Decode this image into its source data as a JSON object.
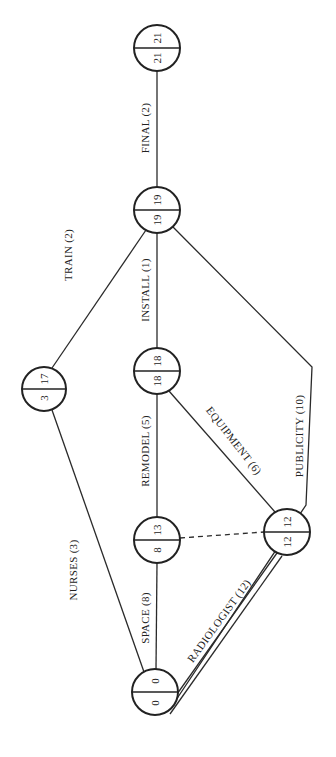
{
  "diagram": {
    "type": "activity-on-arrow network (PERT/CPM)",
    "orientation": "rotated 90 degrees counter-clockwise",
    "nodes": [
      {
        "id": "n0",
        "early": "0",
        "late": "0",
        "cx": 155,
        "cy": 692
      },
      {
        "id": "n8",
        "early": "8",
        "late": "13",
        "cx": 157,
        "cy": 540
      },
      {
        "id": "n12",
        "early": "12",
        "late": "12",
        "cx": 287,
        "cy": 532
      },
      {
        "id": "n18",
        "early": "18",
        "late": "18",
        "cx": 157,
        "cy": 371
      },
      {
        "id": "n19",
        "early": "19",
        "late": "19",
        "cx": 157,
        "cy": 210
      },
      {
        "id": "n21",
        "early": "21",
        "late": "21",
        "cx": 157,
        "cy": 48
      },
      {
        "id": "n3",
        "early": "3",
        "late": "17",
        "cx": 44,
        "cy": 389
      }
    ],
    "activities": [
      {
        "label": "SPACE (8)",
        "from": "0",
        "to": "8/13"
      },
      {
        "label": "NURSES (3)",
        "from": "0",
        "to": "3/17"
      },
      {
        "label": "TRAIN (2)",
        "from": "3/17",
        "to": "19"
      },
      {
        "label": "REMODEL (5)",
        "from": "8/13",
        "to": "18"
      },
      {
        "label": "EQUIPMENT (6)",
        "from": "12",
        "to": "18"
      },
      {
        "label": "INSTALL (1)",
        "from": "18",
        "to": "19"
      },
      {
        "label": "FINAL (2)",
        "from": "19",
        "to": "21"
      },
      {
        "label": "RADIOLOGIST (12)",
        "from": "0",
        "to": "12"
      },
      {
        "label": "PUBLICITY (10)",
        "from": "0",
        "to": "19"
      },
      {
        "label": "dummy",
        "from": "8/13",
        "to": "12",
        "style": "dashed"
      }
    ]
  },
  "labels": {
    "space": "SPACE (8)",
    "nurses": "NURSES (3)",
    "train": "TRAIN (2)",
    "remodel": "REMODEL (5)",
    "equipment": "EQUIPMENT (6)",
    "install": "INSTALL (1)",
    "final": "FINAL (2)",
    "radiologist": "RADIOLOGIST (12)",
    "publicity": "PUBLICITY (10)"
  },
  "nodes": {
    "n0": {
      "early": "0",
      "late": "0"
    },
    "n8": {
      "early": "8",
      "late": "13"
    },
    "n12": {
      "early": "12",
      "late": "12"
    },
    "n18": {
      "early": "18",
      "late": "18"
    },
    "n19": {
      "early": "19",
      "late": "19"
    },
    "n21": {
      "early": "21",
      "late": "21"
    },
    "n3": {
      "early": "3",
      "late": "17"
    }
  },
  "colors": {
    "line": "#222222",
    "background": "#ffffff"
  }
}
